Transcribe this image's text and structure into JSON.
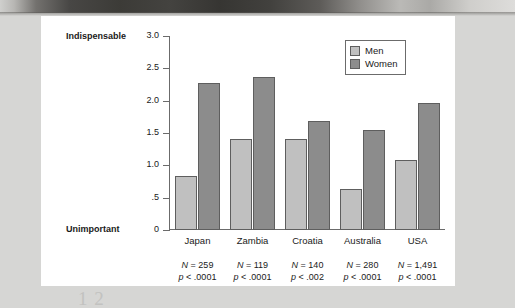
{
  "figure": {
    "plate_background": "#ffffff",
    "page_background": "#d6d6d4",
    "caption_ghost": "1 2"
  },
  "chart_data": {
    "type": "bar",
    "title": "",
    "subtitle": "",
    "xlabel": "",
    "ylabel": "",
    "axis_anchor_high": "Indispensable",
    "axis_anchor_low": "Unimportant",
    "categories": [
      "Japan",
      "Zambia",
      "Croatia",
      "Australia",
      "USA"
    ],
    "series": [
      {
        "name": "Men",
        "color": "#c0c0c0",
        "values": [
          0.84,
          1.41,
          1.4,
          0.64,
          1.08
        ]
      },
      {
        "name": "Women",
        "color": "#8c8c8c",
        "values": [
          2.27,
          2.36,
          1.68,
          1.54,
          1.97
        ]
      }
    ],
    "ylim": [
      0,
      3.0
    ],
    "yticks": [
      0,
      0.5,
      1.0,
      1.5,
      2.0,
      2.5,
      3.0
    ],
    "ytick_labels": [
      "0",
      ".5",
      "1.0",
      "1.5",
      "2.0",
      "2.5",
      "3.0"
    ],
    "grid": false,
    "legend_position": "top-right",
    "annotations": [
      {
        "category": "Japan",
        "n_label": "N",
        "n_value": "= 259",
        "p_value": "p < .0001"
      },
      {
        "category": "Zambia",
        "n_label": "N",
        "n_value": "= 119",
        "p_value": "p < .0001"
      },
      {
        "category": "Croatia",
        "n_label": "N",
        "n_value": "= 140",
        "p_value": "p < .002"
      },
      {
        "category": "Australia",
        "n_label": "N",
        "n_value": "= 280",
        "p_value": "p < .0001"
      },
      {
        "category": "USA",
        "n_label": "N",
        "n_value": "= 1,491",
        "p_value": "p < .0001"
      }
    ]
  }
}
